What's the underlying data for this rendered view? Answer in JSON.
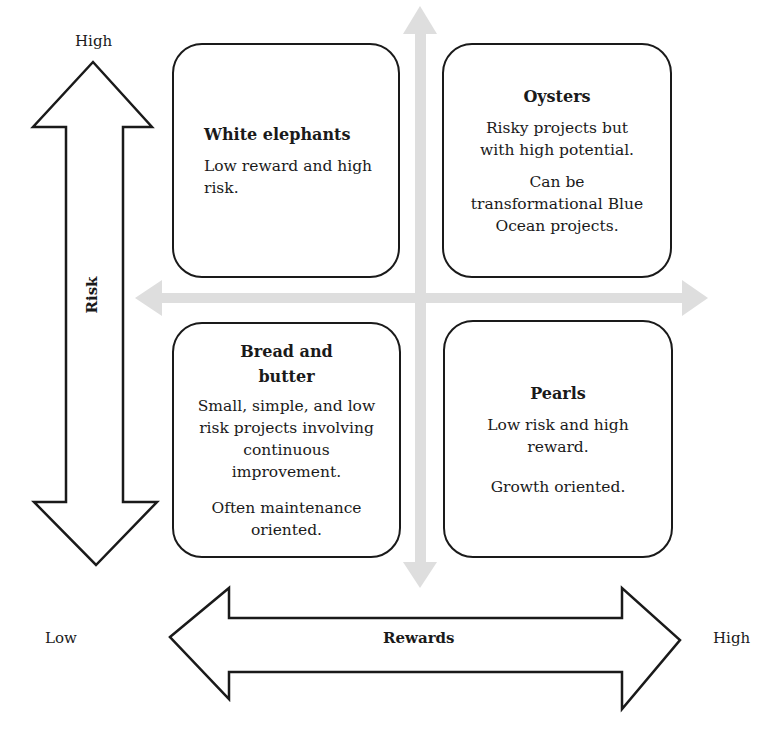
{
  "diagram": {
    "type": "risk-reward matrix",
    "vertical_axis": {
      "label": "Risk",
      "high_label": "High",
      "low_label": ""
    },
    "horizontal_axis": {
      "label": "Rewards",
      "low_label": "Low",
      "high_label": "High"
    },
    "quadrants": [
      {
        "id": "top-left",
        "title": "White elephants",
        "paragraphs": [
          "Low reward and high risk."
        ]
      },
      {
        "id": "top-right",
        "title": "Oysters",
        "paragraphs": [
          "Risky projects but with high potential.",
          "Can be transformational Blue Ocean projects."
        ]
      },
      {
        "id": "bottom-left",
        "title": "Bread and butter",
        "paragraphs": [
          "Small, simple, and low risk projects involving continuous improvement.",
          "Often maintenance oriented."
        ]
      },
      {
        "id": "bottom-right",
        "title": "Pearls",
        "paragraphs": [
          "Low risk and high reward.",
          "Growth oriented."
        ]
      }
    ],
    "colors": {
      "stroke": "#1a1a1a",
      "crosshair": "#dcdcdc",
      "background": "#ffffff"
    }
  }
}
